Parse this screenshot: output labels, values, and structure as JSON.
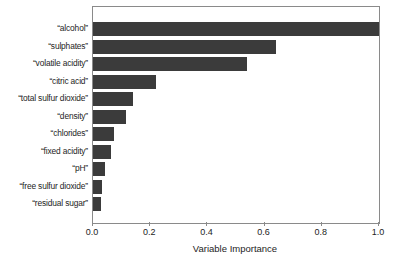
{
  "chart_data": {
    "type": "bar",
    "orientation": "horizontal",
    "title": "",
    "xlabel": "Variable Importance",
    "ylabel": "",
    "xlim": [
      0.0,
      1.0
    ],
    "xticks": [
      "0.0",
      "0.2",
      "0.4",
      "0.6",
      "0.8",
      "1.0"
    ],
    "xtick_values": [
      0.0,
      0.2,
      0.4,
      0.6,
      0.8,
      1.0
    ],
    "grid": false,
    "legend": null,
    "bar_color": "#3b3b3b",
    "frame_color": "#8a8a8a",
    "background": "#ffffff",
    "categories": [
      "“alcohol”",
      "“sulphates”",
      "“volatile acidity”",
      "“citric acid”",
      "“total sulfur dioxide”",
      "“density”",
      "“chlorides”",
      "“fixed acidity”",
      "“pH”",
      "“free sulfur dioxide”",
      "“residual sugar”"
    ],
    "values": [
      1.0,
      0.64,
      0.54,
      0.22,
      0.14,
      0.115,
      0.073,
      0.063,
      0.042,
      0.032,
      0.028
    ]
  }
}
